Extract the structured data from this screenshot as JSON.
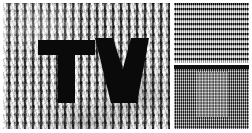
{
  "image": {
    "title": "TV halftone test pattern",
    "description": "Three-panel image-processing test plate: left panel shows the letters TV over a halftone dot grid, top-right shows horizontal scan-line stripes, bottom-right shows a fine orthogonal grid with a lighter inset rectangle.",
    "width_px": 252,
    "height_px": 133,
    "background_color": "#ffffff"
  },
  "panels": {
    "halftone": {
      "name": "halftone-tv-panel",
      "x": 3,
      "y": 3,
      "width": 167,
      "height": 126,
      "pattern": "orthogonal halftone dot grid",
      "grid_period_px": 8,
      "base_color": "#9a9a9a",
      "dark_color": "#0a0a0a",
      "light_color": "#ffffff",
      "wordmark": {
        "text": "TV",
        "color": "#0a0a0a",
        "letters": [
          {
            "glyph": "T",
            "x": 35,
            "y": 37,
            "width": 57,
            "height": 63
          },
          {
            "glyph": "V",
            "x": 92,
            "y": 35,
            "width": 54,
            "height": 65
          }
        ]
      }
    },
    "scanlines": {
      "name": "scanline-stripe-panel",
      "x": 174,
      "y": 3,
      "width": 75,
      "height": 60,
      "pattern": "horizontal scan lines with fine vertical texture",
      "stripe_period_px": 5,
      "dark_color": "#0a0a0a",
      "light_color": "#e8e8e8"
    },
    "fine_grid": {
      "name": "fine-grid-panel",
      "x": 174,
      "y": 65,
      "width": 75,
      "height": 64,
      "pattern": "fine orthogonal grid with lighter inset rectangle",
      "grid_period_px": 3,
      "base_color": "#6a6a6a",
      "inset": {
        "name": "grid-inset-rectangle",
        "x": 22,
        "y": 7,
        "width": 33,
        "height": 45,
        "color": "#bebebe"
      }
    }
  }
}
